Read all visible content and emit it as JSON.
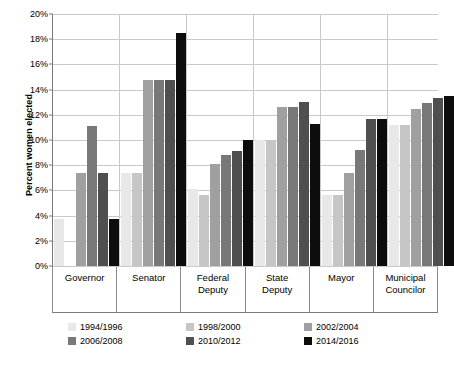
{
  "chart_data": {
    "type": "bar",
    "title": "",
    "xlabel": "",
    "ylabel": "Percent women elected",
    "ylim": [
      0,
      20
    ],
    "ytick_step": 2,
    "ytick_labels": [
      "0%",
      "2%",
      "4%",
      "6%",
      "8%",
      "10%",
      "12%",
      "14%",
      "16%",
      "18%",
      "20%"
    ],
    "grid": true,
    "legend_position": "bottom",
    "categories": [
      "Governor",
      "Senator",
      "Federal Deputy",
      "State Deputy",
      "Mayor",
      "Municipal Councilor"
    ],
    "category_lines": [
      [
        "Governor"
      ],
      [
        "Senator"
      ],
      [
        "Federal",
        "Deputy"
      ],
      [
        "State",
        "Deputy"
      ],
      [
        "Mayor"
      ],
      [
        "Municipal",
        "Councilor"
      ]
    ],
    "series": [
      {
        "name": "1994/1996",
        "color": "#e8e8e8",
        "values": [
          3.7,
          7.4,
          6.1,
          10.0,
          5.6,
          11.2
        ]
      },
      {
        "name": "1998/2000",
        "color": "#c6c6c6",
        "values": [
          0.0,
          7.4,
          5.6,
          10.0,
          5.6,
          11.2
        ]
      },
      {
        "name": "2002/2004",
        "color": "#a0a0a0",
        "values": [
          7.4,
          14.8,
          8.1,
          12.6,
          7.4,
          12.5
        ]
      },
      {
        "name": "2006/2008",
        "color": "#787878",
        "values": [
          11.1,
          14.8,
          8.8,
          12.6,
          9.2,
          12.9
        ]
      },
      {
        "name": "2010/2012",
        "color": "#4f4f4f",
        "values": [
          7.4,
          14.8,
          9.1,
          13.0,
          11.7,
          13.3
        ]
      },
      {
        "name": "2014/2016",
        "color": "#0d0d0d",
        "values": [
          3.7,
          18.5,
          10.0,
          11.3,
          11.7,
          13.5
        ]
      }
    ]
  },
  "legend": {
    "items": [
      {
        "label": "1994/1996",
        "color": "#e8e8e8"
      },
      {
        "label": "1998/2000",
        "color": "#c6c6c6"
      },
      {
        "label": "2002/2004",
        "color": "#a0a0a0"
      },
      {
        "label": "2006/2008",
        "color": "#787878"
      },
      {
        "label": "2010/2012",
        "color": "#4f4f4f"
      },
      {
        "label": "2014/2016",
        "color": "#0d0d0d"
      }
    ]
  },
  "axis": {
    "y_title": "Percent women elected"
  }
}
